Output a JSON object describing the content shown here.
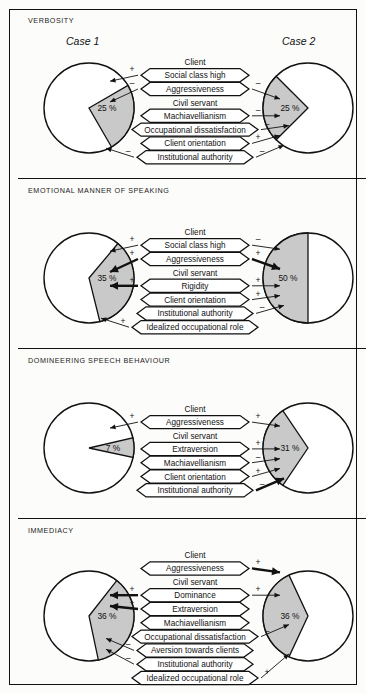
{
  "figure": {
    "case_left_label": "Case 1",
    "case_right_label": "Case 2",
    "group_client": "Client",
    "group_civil_servant": "Civil servant"
  },
  "panels": [
    {
      "title": "VERBOSITY",
      "left_pie": "25 %",
      "right_pie": "25 %",
      "client_items": [
        {
          "label": "Social class high",
          "left_sign": "+",
          "right_sign": ""
        },
        {
          "label": "Aggressiveness",
          "left_sign": "–",
          "right_sign": "–"
        }
      ],
      "civil_items": [
        {
          "label": "Machiavellianism",
          "left_sign": "",
          "right_sign": "–"
        },
        {
          "label": "Occupational dissatisfaction",
          "left_sign": "",
          "right_sign": "–"
        },
        {
          "label": "Client orientation",
          "left_sign": "",
          "right_sign": "+"
        },
        {
          "label": "Institutional authority",
          "left_sign": "–",
          "right_sign": "–"
        }
      ]
    },
    {
      "title": "EMOTIONAL MANNER OF SPEAKING",
      "left_pie": "35 %",
      "right_pie": "50 %",
      "client_items": [
        {
          "label": "Social class high",
          "left_sign": "+",
          "right_sign": "–"
        },
        {
          "label": "Aggressiveness",
          "left_sign": "+",
          "right_sign": "+"
        }
      ],
      "civil_items": [
        {
          "label": "Rigidity",
          "left_sign": "+",
          "right_sign": "+"
        },
        {
          "label": "Client orientation",
          "left_sign": "",
          "right_sign": "+"
        },
        {
          "label": "Institutional authority",
          "left_sign": "",
          "right_sign": "–"
        },
        {
          "label": "Idealized occupational role",
          "left_sign": "+",
          "right_sign": ""
        }
      ]
    },
    {
      "title": "DOMINEERING SPEECH BEHAVIOUR",
      "left_pie": "7 %",
      "right_pie": "31 %",
      "client_items": [
        {
          "label": "Aggressiveness",
          "left_sign": "+",
          "right_sign": "+"
        }
      ],
      "civil_items": [
        {
          "label": "Extraversion",
          "left_sign": "",
          "right_sign": "+"
        },
        {
          "label": "Machiavellianism",
          "left_sign": "",
          "right_sign": "–"
        },
        {
          "label": "Client orientation",
          "left_sign": "",
          "right_sign": "+"
        },
        {
          "label": "Institutional authority",
          "left_sign": "",
          "right_sign": "–"
        }
      ]
    },
    {
      "title": "IMMEDIACY",
      "left_pie": "36 %",
      "right_pie": "36 %",
      "client_items": [
        {
          "label": "Aggressiveness",
          "left_sign": "",
          "right_sign": "+"
        }
      ],
      "civil_items": [
        {
          "label": "Dominance",
          "left_sign": "+",
          "right_sign": "+"
        },
        {
          "label": "Extraversion",
          "left_sign": "+",
          "right_sign": ""
        },
        {
          "label": "Machiavellianism",
          "left_sign": "",
          "right_sign": ""
        },
        {
          "label": "Occupational dissatisfaction",
          "left_sign": "",
          "right_sign": "–"
        },
        {
          "label": "Aversion towards clients",
          "left_sign": "–",
          "right_sign": ""
        },
        {
          "label": "Institutional authority",
          "left_sign": "–",
          "right_sign": ""
        },
        {
          "label": "Idealized occupational role",
          "left_sign": "",
          "right_sign": "+"
        }
      ]
    }
  ],
  "chart_data": {
    "type": "pie",
    "legend": [
      "shaded = explained variance"
    ],
    "charts": [
      {
        "panel": "VERBOSITY",
        "case": "Case 1",
        "value": 25,
        "label": "25 %",
        "start_deg": 330,
        "sweep_deg": 90,
        "shape": "wedge-apex-left"
      },
      {
        "panel": "VERBOSITY",
        "case": "Case 2",
        "value": 25,
        "label": "25 %",
        "start_deg": 135,
        "sweep_deg": 90,
        "shape": "wedge-apex-right"
      },
      {
        "panel": "EMOTIONAL MANNER OF SPEAKING",
        "case": "Case 1",
        "value": 35,
        "label": "35 %",
        "start_deg": 310,
        "sweep_deg": 126,
        "shape": "wedge-apex-left"
      },
      {
        "panel": "EMOTIONAL MANNER OF SPEAKING",
        "case": "Case 2",
        "value": 50,
        "label": "50 %",
        "start_deg": 180,
        "sweep_deg": 180,
        "shape": "half-left"
      },
      {
        "panel": "DOMINEERING SPEECH BEHAVIOUR",
        "case": "Case 1",
        "value": 7,
        "label": "7 %",
        "start_deg": 347,
        "sweep_deg": 25,
        "shape": "wedge-apex-left"
      },
      {
        "panel": "DOMINEERING SPEECH BEHAVIOUR",
        "case": "Case 2",
        "value": 31,
        "label": "31 %",
        "start_deg": 124,
        "sweep_deg": 112,
        "shape": "wedge-apex-right"
      },
      {
        "panel": "IMMEDIACY",
        "case": "Case 1",
        "value": 36,
        "label": "36 %",
        "start_deg": 308,
        "sweep_deg": 130,
        "shape": "wedge-apex-left"
      },
      {
        "panel": "IMMEDIACY",
        "case": "Case 2",
        "value": 36,
        "label": "36 %",
        "start_deg": 115,
        "sweep_deg": 130,
        "shape": "wedge-apex-right"
      }
    ],
    "xlabel": "",
    "ylabel": "",
    "grid": false
  },
  "colors": {
    "ink": "#111111",
    "wedge_fill": "#c9c9c9",
    "page_bg": "#fcfcfa",
    "box_fill": "#ffffff"
  }
}
